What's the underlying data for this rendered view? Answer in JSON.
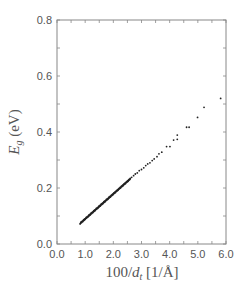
{
  "chart_data": {
    "type": "scatter",
    "title": "",
    "xlabel": "100/d_t [1/Å]",
    "ylabel": "E_g (eV)",
    "xlim": [
      0.0,
      6.0
    ],
    "ylim": [
      0.0,
      0.8
    ],
    "x_ticks": [
      "0.0",
      "1.0",
      "2.0",
      "3.0",
      "4.0",
      "5.0",
      "6.0"
    ],
    "y_ticks": [
      "0.0",
      "0.2",
      "0.4",
      "0.6",
      "0.8"
    ],
    "x_minor_step": 0.5,
    "y_minor_step": 0.1,
    "grid": false,
    "legend": null,
    "marker_color": "#222222",
    "axis_color": "#888888",
    "dense_segment": {
      "x_start": 0.82,
      "x_end": 2.6,
      "slope": 0.0895,
      "n_points": 140
    },
    "series": [
      {
        "name": "Eg",
        "points": [
          [
            2.65,
            0.238
          ],
          [
            2.72,
            0.244
          ],
          [
            2.78,
            0.25
          ],
          [
            2.85,
            0.254
          ],
          [
            2.92,
            0.262
          ],
          [
            3.0,
            0.266
          ],
          [
            3.08,
            0.272
          ],
          [
            3.15,
            0.28
          ],
          [
            3.22,
            0.286
          ],
          [
            3.3,
            0.29
          ],
          [
            3.38,
            0.298
          ],
          [
            3.45,
            0.304
          ],
          [
            3.55,
            0.312
          ],
          [
            3.62,
            0.322
          ],
          [
            3.72,
            0.328
          ],
          [
            3.89,
            0.348
          ],
          [
            4.01,
            0.348
          ],
          [
            4.14,
            0.371
          ],
          [
            4.27,
            0.374
          ],
          [
            4.27,
            0.389
          ],
          [
            4.6,
            0.417
          ],
          [
            4.69,
            0.417
          ],
          [
            4.99,
            0.452
          ],
          [
            5.22,
            0.488
          ],
          [
            5.81,
            0.52
          ]
        ]
      }
    ]
  }
}
